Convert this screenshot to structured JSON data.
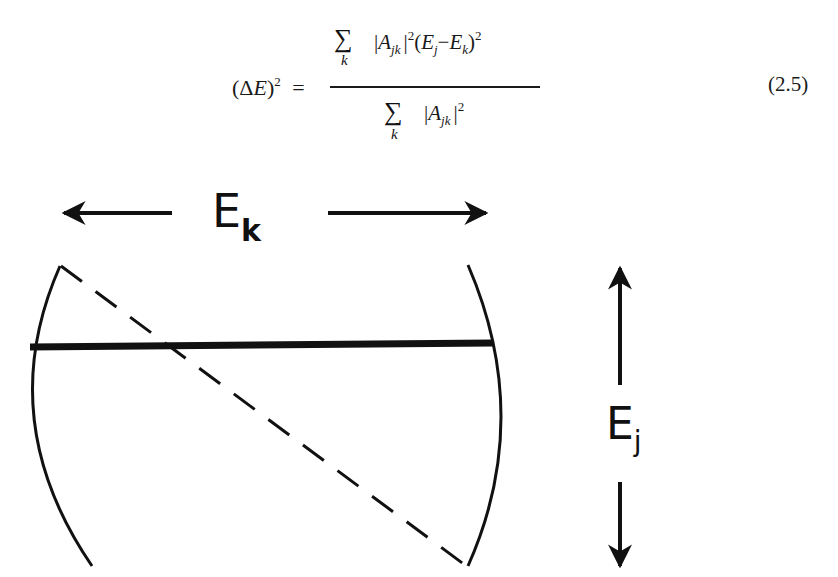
{
  "equation": {
    "lhs_delta": "Δ",
    "lhs_var": "E",
    "lhs_power": "2",
    "equals": "=",
    "numerator": {
      "sum_symbol": "∑",
      "sum_index": "k",
      "abs_open": "|",
      "amp": "A",
      "amp_sub": "jk",
      "abs_close": "|",
      "amp_power": "2",
      "paren_open": "(",
      "e1": "E",
      "e1_sub": "j",
      "minus": "−",
      "e2": "E",
      "e2_sub": "k",
      "paren_close": ")",
      "power": "2"
    },
    "denominator": {
      "sum_symbol": "∑",
      "sum_index": "k",
      "abs_open": "|",
      "amp": "A",
      "amp_sub": "jk",
      "abs_close": "|",
      "amp_power": "2"
    },
    "number": "(2.5)"
  },
  "figure": {
    "horizontal_label": "E",
    "horizontal_label_sub": "k",
    "vertical_label": "E",
    "vertical_label_sub": "j",
    "stroke_color": "#111111"
  }
}
